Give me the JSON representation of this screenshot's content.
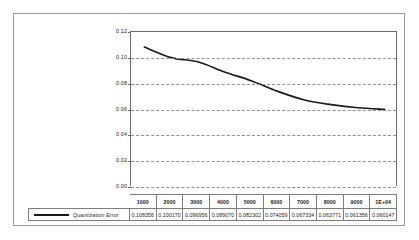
{
  "chart_data": {
    "type": "line",
    "title": "",
    "xlabel": "",
    "ylabel": "",
    "categories": [
      "1000",
      "2000",
      "3000",
      "4000",
      "5000",
      "6000",
      "7000",
      "8000",
      "9000",
      "1E+04"
    ],
    "series": [
      {
        "name": "Quantization Error",
        "values": [
          0.108356,
          0.10017,
          0.096956,
          0.08907,
          0.082302,
          0.074059,
          0.067334,
          0.063771,
          0.061356,
          0.060147
        ],
        "value_labels": [
          "0.108356",
          "0.100170",
          "0.096956",
          "0.089070",
          "0.082302",
          "0.074059",
          "0.067334",
          "0.063771",
          "0.061356",
          "0.060147"
        ],
        "color": "#1a1a1a"
      }
    ],
    "ylim": [
      0.0,
      0.12
    ],
    "ytick_labels": [
      "0.12",
      "0.10",
      "0.08",
      "0.06",
      "0.04",
      "0.02",
      "0.00"
    ],
    "ytick_values": [
      0.12,
      0.1,
      0.08,
      0.06,
      0.04,
      0.02,
      0.0
    ],
    "grid": true,
    "grid_style": "dashed-horizontal",
    "grid_color": "#8d8d9c",
    "legend_position": "bottom-left-in-table",
    "has_data_table": true,
    "plot_border_color": "#6d6d6d",
    "frame_border_color": "#9a9a9a",
    "background": "#ffffff"
  }
}
